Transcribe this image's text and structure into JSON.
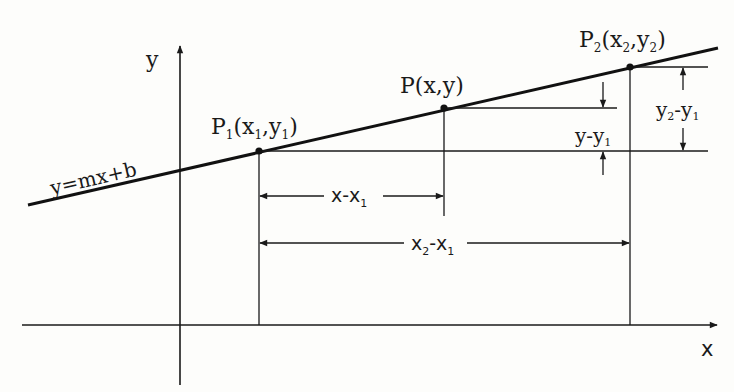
{
  "diagram": {
    "axes": {
      "x_label": "x",
      "y_label": "y"
    },
    "line": {
      "equation_label": "y=mx+b",
      "start": [
        28,
        205
      ],
      "end": [
        718,
        48
      ]
    },
    "points": [
      {
        "id": "P1",
        "label_main": "P",
        "label_sub": "1",
        "coords_text": "(x",
        "coords_sub1": "1",
        "coords_mid": ",y",
        "coords_sub2": "1",
        "coords_end": ")",
        "pos": [
          259,
          151
        ]
      },
      {
        "id": "P",
        "label": "P(x,y)",
        "pos": [
          444,
          108
        ]
      },
      {
        "id": "P2",
        "label_main": "P",
        "label_sub": "2",
        "coords_text": "(x",
        "coords_sub1": "2",
        "coords_mid": ",y",
        "coords_sub2": "2",
        "coords_end": ")",
        "pos": [
          630,
          67
        ]
      }
    ],
    "dimensions": {
      "x_minus_x1": {
        "base": "x-x",
        "sub": "1"
      },
      "x2_minus_x1": {
        "a": "x",
        "a_sub": "2",
        "mid": "-x",
        "b_sub": "1"
      },
      "y_minus_y1": {
        "base": "y-y",
        "sub": "1"
      },
      "y2_minus_y1": {
        "a": "y",
        "a_sub": "2",
        "mid": "-y",
        "b_sub": "1"
      }
    },
    "colors": {
      "ink": "#1a1a1a",
      "background": "#fdfdfb"
    }
  }
}
